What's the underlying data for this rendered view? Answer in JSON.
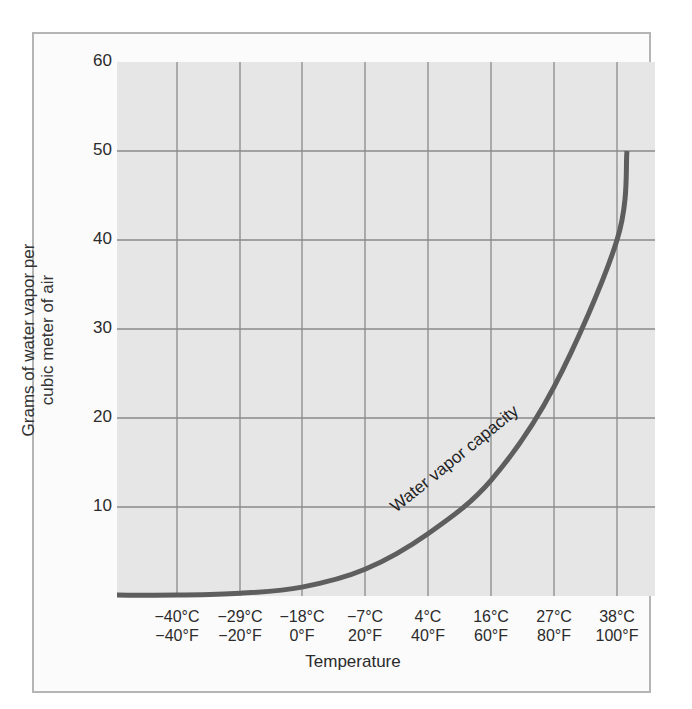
{
  "chart_data": {
    "type": "line",
    "title": "",
    "xlabel": "Temperature",
    "ylabel": "Grams of water vapor per cubic meter of air",
    "ylim": [
      0,
      60
    ],
    "yticks": [
      10,
      20,
      30,
      40,
      50,
      60
    ],
    "grid": true,
    "legend": null,
    "x_tick_labels": [
      {
        "c": "−40°C",
        "f": "−40°F"
      },
      {
        "c": "−29°C",
        "f": "−20°F"
      },
      {
        "c": "−18°C",
        "f": "0°F"
      },
      {
        "c": "−7°C",
        "f": "20°F"
      },
      {
        "c": "4°C",
        "f": "40°F"
      },
      {
        "c": "16°C",
        "f": "60°F"
      },
      {
        "c": "27°C",
        "f": "80°F"
      },
      {
        "c": "38°C",
        "f": "100°F"
      }
    ],
    "series": [
      {
        "name": "Water vapor capacity",
        "x_celsius": [
          -40,
          -29,
          -18,
          -7,
          4,
          16,
          27,
          38
        ],
        "values": [
          0.1,
          0.3,
          1,
          3,
          7,
          13,
          23.5,
          40
        ]
      }
    ],
    "annotations": [
      "Water vapor capacity"
    ],
    "curve_end": {
      "x_celsius": 40,
      "value": 50
    }
  },
  "labels": {
    "y_axis_line1": "Grams of water vapor per",
    "y_axis_line2": "cubic meter of air",
    "x_axis": "Temperature",
    "curve_label": "Water vapor capacity"
  }
}
